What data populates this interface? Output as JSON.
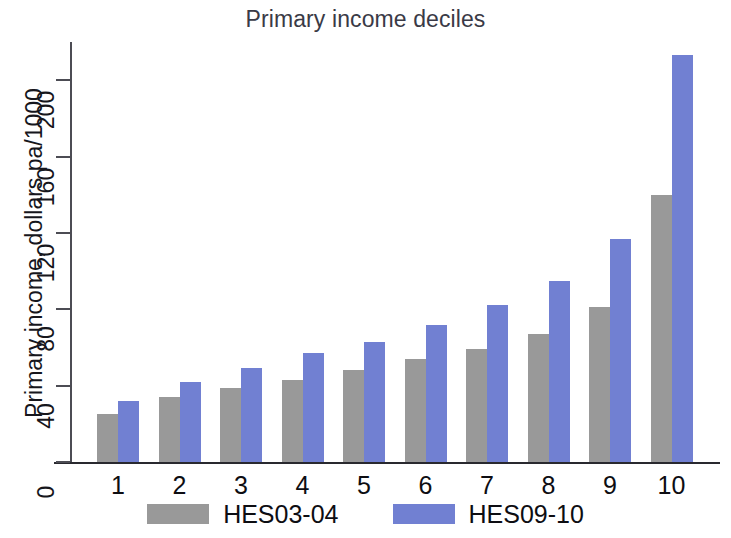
{
  "chart_data": {
    "type": "bar",
    "title": "Primary income deciles",
    "xlabel": "",
    "ylabel": "Primary income, dollars pa/1000",
    "categories": [
      "1",
      "2",
      "3",
      "4",
      "5",
      "6",
      "7",
      "8",
      "9",
      "10"
    ],
    "series": [
      {
        "name": "HES03-04",
        "color": "#999999",
        "values": [
          25,
          34,
          39,
          43,
          48,
          54,
          59,
          67,
          81,
          140
        ]
      },
      {
        "name": "HES09-10",
        "color": "#7180d2",
        "values": [
          32,
          42,
          49,
          57,
          63,
          72,
          82,
          95,
          117,
          213
        ]
      }
    ],
    "ylim": [
      0,
      220
    ],
    "yticks": [
      0,
      40,
      80,
      120,
      160,
      200
    ],
    "ytick_labels": [
      "0",
      "40",
      "80",
      "120",
      "160",
      "200"
    ],
    "grid": false,
    "legend_position": "bottom"
  },
  "legend": {
    "items": [
      {
        "label": "HES03-04",
        "swatch": "series-a"
      },
      {
        "label": "HES09-10",
        "swatch": "series-b"
      }
    ]
  }
}
